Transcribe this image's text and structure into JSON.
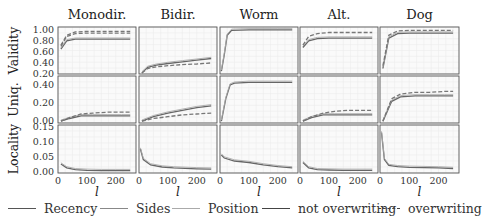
{
  "chart_data": {
    "type": "line",
    "layout": "small-multiples grid 3 rows x 5 columns",
    "columns": [
      "Monodir.",
      "Bidir.",
      "Worm",
      "Alt.",
      "Dog"
    ],
    "rows": [
      {
        "ylabel": "Validity",
        "yticks": [
          "0.20",
          "0.40",
          "0.60",
          "0.80",
          "1.00"
        ],
        "ylim": [
          0.2,
          1.05
        ]
      },
      {
        "ylabel": "Uniq.",
        "yticks": [
          "0.00",
          "0.20",
          "0.40"
        ],
        "ylim": [
          -0.02,
          0.5
        ]
      },
      {
        "ylabel": "Locality",
        "yticks": [
          "0.00",
          "0.05",
          "0.10",
          "0.15"
        ],
        "ylim": [
          -0.005,
          0.155
        ]
      }
    ],
    "xlabel": "l",
    "xticks": [
      "0",
      "100",
      "200"
    ],
    "xlim": [
      0,
      270
    ],
    "grid": true,
    "legend_position": "bottom",
    "legend": [
      {
        "label": "Recency",
        "style": "solid",
        "color": "#555555"
      },
      {
        "label": "Sides",
        "style": "solid",
        "color": "#888888"
      },
      {
        "label": "Position",
        "style": "solid",
        "color": "#aaaaaa"
      },
      {
        "label": "not overwriting",
        "style": "solid",
        "color": "#444444"
      },
      {
        "label": "overwriting",
        "style": "dashed",
        "color": "#444444"
      }
    ],
    "panels": {
      "Validity": {
        "Monodir.": {
          "x": [
            10,
            30,
            60,
            100,
            150,
            200,
            250
          ],
          "series": [
            {
              "name": "not overwriting",
              "values": [
                0.65,
                0.8,
                0.83,
                0.83,
                0.83,
                0.83,
                0.83
              ]
            },
            {
              "name": "overwriting",
              "values": [
                0.7,
                0.88,
                0.93,
                0.94,
                0.94,
                0.94,
                0.94
              ]
            },
            {
              "name": "overwriting (upper)",
              "values": [
                0.72,
                0.9,
                0.96,
                0.97,
                0.97,
                0.97,
                0.97
              ]
            }
          ]
        },
        "Bidir.": {
          "x": [
            10,
            30,
            60,
            100,
            150,
            200,
            250
          ],
          "series": [
            {
              "name": "not overwriting",
              "values": [
                0.22,
                0.32,
                0.36,
                0.39,
                0.42,
                0.45,
                0.48
              ]
            },
            {
              "name": "overwriting",
              "values": [
                0.22,
                0.3,
                0.33,
                0.35,
                0.37,
                0.38,
                0.4
              ]
            }
          ]
        },
        "Worm": {
          "x": [
            5,
            15,
            25,
            40,
            100,
            200,
            250
          ],
          "series": [
            {
              "name": "not overwriting",
              "values": [
                0.25,
                0.55,
                0.9,
                0.99,
                1.0,
                1.0,
                1.0
              ]
            }
          ]
        },
        "Alt.": {
          "x": [
            10,
            30,
            60,
            100,
            150,
            200,
            250
          ],
          "series": [
            {
              "name": "not overwriting",
              "values": [
                0.68,
                0.8,
                0.84,
                0.85,
                0.85,
                0.85,
                0.85
              ]
            },
            {
              "name": "overwriting",
              "values": [
                0.72,
                0.88,
                0.93,
                0.95,
                0.95,
                0.95,
                0.95
              ]
            }
          ]
        },
        "Dog": {
          "x": [
            10,
            30,
            60,
            100,
            150,
            200,
            250
          ],
          "series": [
            {
              "name": "not overwriting",
              "values": [
                0.3,
                0.85,
                0.93,
                0.94,
                0.94,
                0.94,
                0.94
              ]
            },
            {
              "name": "overwriting",
              "values": [
                0.35,
                0.9,
                0.98,
                0.99,
                0.99,
                0.99,
                0.99
              ]
            }
          ]
        }
      },
      "Uniq.": {
        "Monodir.": {
          "x": [
            10,
            40,
            80,
            120,
            170,
            220,
            250
          ],
          "series": [
            {
              "name": "not overwriting",
              "values": [
                0.0,
                0.03,
                0.06,
                0.06,
                0.06,
                0.06,
                0.06
              ]
            },
            {
              "name": "overwriting",
              "values": [
                0.0,
                0.04,
                0.08,
                0.09,
                0.1,
                0.1,
                0.1
              ]
            }
          ]
        },
        "Bidir.": {
          "x": [
            10,
            50,
            100,
            150,
            200,
            250
          ],
          "series": [
            {
              "name": "not overwriting",
              "values": [
                0.0,
                0.05,
                0.09,
                0.12,
                0.15,
                0.17
              ]
            },
            {
              "name": "overwriting",
              "values": [
                0.0,
                0.03,
                0.05,
                0.07,
                0.08,
                0.09
              ]
            }
          ]
        },
        "Worm": {
          "x": [
            5,
            20,
            35,
            50,
            100,
            200,
            250
          ],
          "series": [
            {
              "name": "not overwriting",
              "values": [
                0.0,
                0.25,
                0.4,
                0.42,
                0.43,
                0.43,
                0.43
              ]
            }
          ]
        },
        "Alt.": {
          "x": [
            10,
            40,
            80,
            120,
            170,
            220,
            250
          ],
          "series": [
            {
              "name": "not overwriting",
              "values": [
                0.0,
                0.04,
                0.07,
                0.07,
                0.07,
                0.07,
                0.07
              ]
            },
            {
              "name": "overwriting",
              "values": [
                0.0,
                0.05,
                0.09,
                0.11,
                0.12,
                0.12,
                0.12
              ]
            }
          ]
        },
        "Dog": {
          "x": [
            10,
            40,
            70,
            120,
            170,
            220,
            250
          ],
          "series": [
            {
              "name": "not overwriting",
              "values": [
                0.0,
                0.22,
                0.27,
                0.28,
                0.28,
                0.28,
                0.28
              ]
            },
            {
              "name": "overwriting",
              "values": [
                0.0,
                0.25,
                0.3,
                0.32,
                0.32,
                0.33,
                0.33
              ]
            }
          ]
        }
      },
      "Locality": {
        "Monodir.": {
          "x": [
            10,
            30,
            60,
            100,
            150,
            200,
            250
          ],
          "series": [
            {
              "name": "not overwriting",
              "values": [
                0.025,
                0.012,
                0.006,
                0.004,
                0.003,
                0.003,
                0.003
              ]
            }
          ]
        },
        "Bidir.": {
          "x": [
            5,
            15,
            40,
            80,
            120,
            200,
            250
          ],
          "series": [
            {
              "name": "not overwriting",
              "values": [
                0.075,
                0.04,
                0.022,
                0.015,
                0.012,
                0.009,
                0.008
              ]
            }
          ]
        },
        "Worm": {
          "x": [
            5,
            15,
            50,
            100,
            150,
            200,
            250
          ],
          "series": [
            {
              "name": "not overwriting",
              "values": [
                0.055,
                0.045,
                0.035,
                0.03,
                0.022,
                0.016,
                0.012
              ]
            }
          ]
        },
        "Alt.": {
          "x": [
            10,
            30,
            60,
            100,
            150,
            200,
            250
          ],
          "series": [
            {
              "name": "not overwriting",
              "values": [
                0.03,
                0.012,
                0.006,
                0.005,
                0.004,
                0.004,
                0.004
              ]
            }
          ]
        },
        "Dog": {
          "x": [
            5,
            15,
            30,
            60,
            100,
            200,
            250
          ],
          "series": [
            {
              "name": "not overwriting",
              "values": [
                0.13,
                0.04,
                0.02,
                0.016,
                0.014,
                0.012,
                0.01
              ]
            }
          ]
        }
      }
    }
  },
  "legend": {
    "items": [
      {
        "label": "Recency"
      },
      {
        "label": "Sides"
      },
      {
        "label": "Position"
      },
      {
        "label": "not overwriting"
      },
      {
        "label": "overwriting"
      }
    ]
  }
}
